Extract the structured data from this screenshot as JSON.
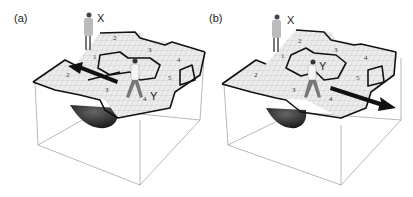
{
  "figure": {
    "panels": [
      {
        "id": "a",
        "label": "(a)",
        "person_top_label": "X",
        "person_walking_label": "Y",
        "room_numbers": [
          "1",
          "2",
          "2",
          "3",
          "3",
          "4",
          "4",
          "5"
        ],
        "arrow_direction": "left"
      },
      {
        "id": "b",
        "label": "(b)",
        "person_top_label": "X",
        "person_walking_label": "Y",
        "room_numbers": [
          "1",
          "2",
          "2",
          "3",
          "3",
          "4",
          "4",
          "5"
        ],
        "arrow_direction": "right"
      }
    ],
    "colors": {
      "floor": "#e8e8e8",
      "grid": "#b8b8b8",
      "walls": "#111111",
      "box": "#888888",
      "well": "#2a2a2a",
      "arrow": "#111111"
    }
  }
}
